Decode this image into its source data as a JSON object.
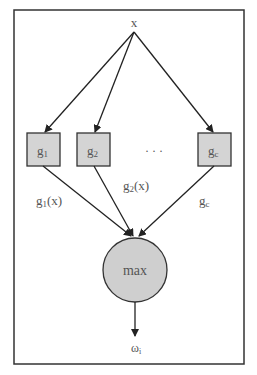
{
  "diagram": {
    "type": "classifier-discriminant-functions",
    "colors": {
      "frame": "#333333",
      "box_fill": "#d4d4d4",
      "box_stroke": "#333333",
      "circle_fill": "#cfcfcf",
      "line": "#222222",
      "text": "#555555"
    },
    "input": {
      "label": "x"
    },
    "functions": [
      {
        "id": "g1",
        "base": "g",
        "sub": "1",
        "output_label": {
          "base": "g",
          "sub": "1",
          "suffix": "(x)"
        }
      },
      {
        "id": "g2",
        "base": "g",
        "sub": "2",
        "output_label": {
          "base": "g",
          "sub": "2",
          "suffix": "(x)"
        }
      },
      {
        "id": "gc",
        "base": "g",
        "sub": "c",
        "output_label": {
          "base": "g",
          "sub": "c",
          "suffix": ""
        }
      }
    ],
    "ellipsis": "· · ·",
    "aggregator": {
      "label": "max"
    },
    "output": {
      "base": "ω",
      "sub": "i"
    }
  }
}
